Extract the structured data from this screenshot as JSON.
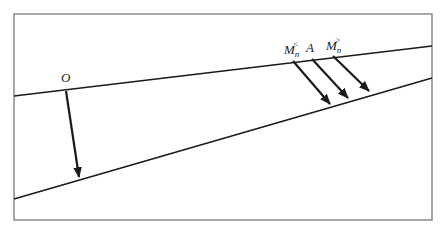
{
  "diagram": {
    "frame": {
      "x": 14,
      "y": 14,
      "width": 418,
      "height": 206,
      "stroke": "#8a8a8a"
    },
    "lines": [
      {
        "id": "upper-line",
        "x1": 14,
        "y1": 96,
        "x2": 432,
        "y2": 46
      },
      {
        "id": "lower-line",
        "x1": 14,
        "y1": 199,
        "x2": 432,
        "y2": 78
      }
    ],
    "arrows": [
      {
        "id": "arrow-O",
        "x1": 66,
        "y1": 91,
        "x2": 79,
        "y2": 177
      },
      {
        "id": "arrow-Mn-less",
        "x1": 293,
        "y1": 61,
        "x2": 330,
        "y2": 104
      },
      {
        "id": "arrow-A",
        "x1": 312,
        "y1": 59,
        "x2": 348,
        "y2": 98
      },
      {
        "id": "arrow-Mn-greater",
        "x1": 333,
        "y1": 56,
        "x2": 369,
        "y2": 91
      }
    ],
    "labels": {
      "O": {
        "text": "O",
        "x": 61,
        "y": 82
      },
      "Mn_less": {
        "base": "M",
        "sub": "n",
        "sup": "<",
        "x": 284,
        "y": 54
      },
      "A": {
        "text": "A",
        "x": 306,
        "y": 52
      },
      "Mn_greater": {
        "base": "M",
        "sub": "n",
        "sup": ">",
        "x": 326,
        "y": 50
      }
    },
    "colors": {
      "line": "#1a1a1a",
      "frame": "#8a8a8a",
      "background": "#ffffff"
    }
  }
}
